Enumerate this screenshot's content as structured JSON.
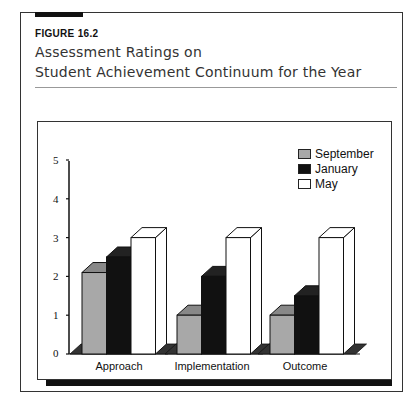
{
  "figure": {
    "label": "FIGURE 16.2",
    "title_line1": "Assessment Ratings on",
    "title_line2": "Student Achievement Continuum for the Year"
  },
  "legend": [
    {
      "name": "September",
      "color": "#a8a8a8"
    },
    {
      "name": "January",
      "color": "#111111"
    },
    {
      "name": "May",
      "color": "#ffffff"
    }
  ],
  "axis": {
    "y_ticks": [
      "0",
      "1",
      "2",
      "3",
      "4",
      "5"
    ]
  },
  "categories": [
    "Approach",
    "Implementation",
    "Outcome"
  ],
  "chart_data": {
    "type": "bar",
    "title": "Assessment Ratings on Student Achievement Continuum for the Year",
    "categories": [
      "Approach",
      "Implementation",
      "Outcome"
    ],
    "series": [
      {
        "name": "September",
        "values": [
          2.1,
          1.0,
          1.0
        ]
      },
      {
        "name": "January",
        "values": [
          2.5,
          2.0,
          1.5
        ]
      },
      {
        "name": "May",
        "values": [
          3.0,
          3.0,
          3.0
        ]
      }
    ],
    "xlabel": "",
    "ylabel": "",
    "ylim": [
      0,
      5
    ],
    "yticks": [
      0,
      1,
      2,
      3,
      4,
      5
    ],
    "grid": false,
    "legend_position": "top-right",
    "style": "3d-clustered"
  }
}
